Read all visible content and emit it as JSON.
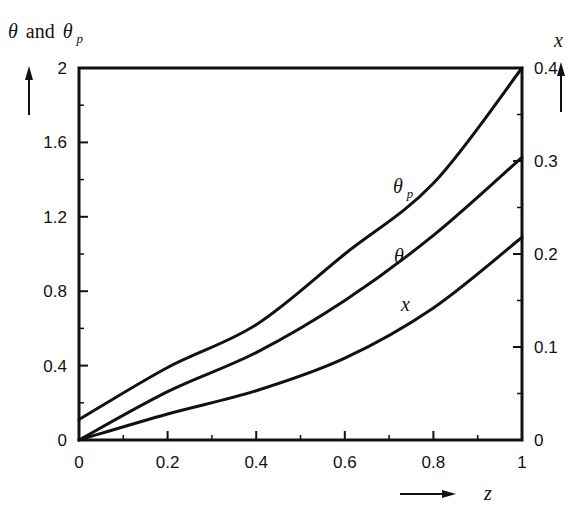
{
  "chart_data": {
    "type": "line",
    "title": "",
    "xlabel": "z",
    "ylabel_left": "θ and θp",
    "ylabel_right": "x",
    "xlim": [
      0,
      1
    ],
    "ylim_left": [
      0,
      2
    ],
    "ylim_right": [
      0,
      0.4
    ],
    "x_ticks": [
      "0",
      "0.2",
      "0.4",
      "0.6",
      "0.8",
      "1"
    ],
    "y_ticks_left": [
      "0",
      "0.4",
      "0.8",
      "1.2",
      "1.6",
      "2"
    ],
    "y_ticks_right": [
      "0",
      "0.1",
      "0.2",
      "0.3",
      "0.4"
    ],
    "grid": false,
    "legend": "inline curve labels",
    "x": [
      0,
      0.2,
      0.4,
      0.6,
      0.8,
      1.0
    ],
    "series": [
      {
        "name": "θp",
        "axis": "left",
        "values": [
          0.11,
          0.39,
          0.62,
          1.0,
          1.38,
          2.0
        ]
      },
      {
        "name": "θ",
        "axis": "left",
        "values": [
          0.0,
          0.26,
          0.47,
          0.75,
          1.1,
          1.52
        ]
      },
      {
        "name": "x",
        "axis": "right",
        "values": [
          0.0,
          0.028,
          0.053,
          0.088,
          0.142,
          0.218
        ]
      }
    ]
  },
  "labels": {
    "left_axis_theta": "θ",
    "left_axis_and": "and",
    "left_axis_theta_p": "θ",
    "left_axis_sub_p": "p",
    "right_axis": "x",
    "x_axis": "z",
    "curve_theta_p": "θ",
    "curve_theta_p_sub": "p",
    "curve_theta": "θ",
    "curve_x": "x"
  }
}
